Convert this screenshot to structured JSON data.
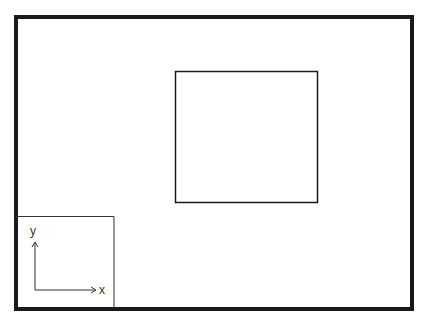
{
  "diagram": {
    "frame": {
      "x": 16,
      "y": 17,
      "width": 396,
      "height": 292,
      "stroke": "#1a1a1a",
      "stroke_width": 4
    },
    "rectangle": {
      "x": 175.5,
      "y": 71.5,
      "width": 142,
      "height": 131,
      "stroke": "#1a1a1a",
      "stroke_width": 1.5
    },
    "axes_inset": {
      "box": {
        "x": 16,
        "y": 216.5,
        "width": 98,
        "height": 92,
        "stroke": "#333333",
        "stroke_width": 1
      },
      "origin": {
        "x": 35,
        "y": 290
      },
      "x_axis_end": {
        "x": 95,
        "y": 290
      },
      "y_axis_end": {
        "x": 35,
        "y": 243
      },
      "x_label": "x",
      "y_label": "y"
    }
  }
}
